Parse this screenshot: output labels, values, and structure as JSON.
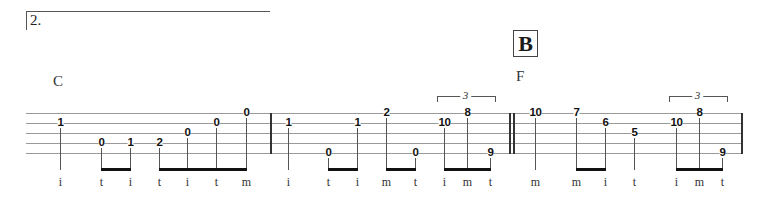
{
  "section": {
    "number": "2."
  },
  "rehearsal_mark": "B",
  "chords": [
    {
      "label": "C",
      "x": 53,
      "y": 73
    },
    {
      "label": "F",
      "x": 516,
      "y": 68
    }
  ],
  "staff": {
    "left": 26,
    "right": 741,
    "lines_y": [
      113,
      123,
      133,
      143,
      153
    ]
  },
  "barlines": [
    {
      "x": 270,
      "type": "single"
    },
    {
      "x": 511,
      "type": "double"
    },
    {
      "x": 741,
      "type": "single"
    }
  ],
  "notes": [
    {
      "x": 60,
      "string": 2,
      "fret": "1",
      "finger": "i"
    },
    {
      "x": 101,
      "string": 4,
      "fret": "0",
      "finger": "t"
    },
    {
      "x": 130,
      "string": 4,
      "fret": "1",
      "finger": "i"
    },
    {
      "x": 159,
      "string": 4,
      "fret": "2",
      "finger": "t"
    },
    {
      "x": 187,
      "string": 3,
      "fret": "0",
      "finger": "i"
    },
    {
      "x": 216,
      "string": 2,
      "fret": "0",
      "finger": "t"
    },
    {
      "x": 246,
      "string": 1,
      "fret": "0",
      "finger": "m"
    },
    {
      "x": 288,
      "string": 2,
      "fret": "1",
      "finger": "i"
    },
    {
      "x": 328,
      "string": 5,
      "fret": "0",
      "finger": "t"
    },
    {
      "x": 357,
      "string": 2,
      "fret": "1",
      "finger": "i"
    },
    {
      "x": 386,
      "string": 1,
      "fret": "2",
      "finger": "m"
    },
    {
      "x": 415,
      "string": 5,
      "fret": "0",
      "finger": "t"
    },
    {
      "x": 444,
      "string": 2,
      "fret": "10",
      "finger": "i"
    },
    {
      "x": 467,
      "string": 1,
      "fret": "8",
      "finger": "m"
    },
    {
      "x": 490,
      "string": 5,
      "fret": "9",
      "finger": "t"
    },
    {
      "x": 535,
      "string": 1,
      "fret": "10",
      "finger": "m"
    },
    {
      "x": 576,
      "string": 1,
      "fret": "7",
      "finger": "m"
    },
    {
      "x": 605,
      "string": 2,
      "fret": "6",
      "finger": "i"
    },
    {
      "x": 634,
      "string": 3,
      "fret": "5",
      "finger": "t"
    },
    {
      "x": 676,
      "string": 2,
      "fret": "10",
      "finger": "i"
    },
    {
      "x": 699,
      "string": 1,
      "fret": "8",
      "finger": "m"
    },
    {
      "x": 722,
      "string": 5,
      "fret": "9",
      "finger": "t"
    }
  ],
  "beams": [
    {
      "x1": 101,
      "x2": 130
    },
    {
      "x1": 159,
      "x2": 246
    },
    {
      "x1": 328,
      "x2": 357
    },
    {
      "x1": 386,
      "x2": 415
    },
    {
      "x1": 444,
      "x2": 490
    },
    {
      "x1": 576,
      "x2": 605
    },
    {
      "x1": 676,
      "x2": 722
    }
  ],
  "tuplets": [
    {
      "x1": 437,
      "x2": 494,
      "label": "3"
    },
    {
      "x1": 669,
      "x2": 726,
      "label": "3"
    }
  ]
}
